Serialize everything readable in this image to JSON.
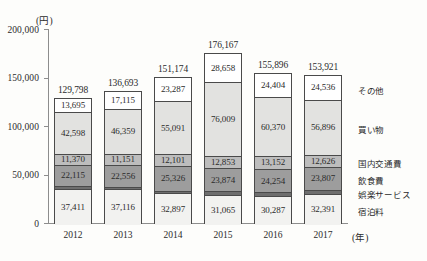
{
  "chart_data": {
    "type": "bar",
    "stacked": true,
    "title": "",
    "xlabel": "(年)",
    "ylabel": "(円)",
    "ylim": [
      0,
      200000
    ],
    "grid": false,
    "legend_position": "right",
    "y_ticks": [
      "0",
      "50,000",
      "100,000",
      "150,000",
      "200,000"
    ],
    "y_tick_values": [
      0,
      50000,
      100000,
      150000,
      200000
    ],
    "categories": [
      "2012",
      "2013",
      "2014",
      "2015",
      "2016",
      "2017"
    ],
    "totals": [
      129798,
      136693,
      151174,
      176167,
      155896,
      153921
    ],
    "total_labels": [
      "129,798",
      "136,693",
      "151,174",
      "176,167",
      "155,896",
      "153,921"
    ],
    "series": [
      {
        "name": "宿泊料",
        "color": "#f2f2f0",
        "values": [
          37411,
          37116,
          32897,
          31065,
          30287,
          32391
        ],
        "labels": [
          "37,411",
          "37,116",
          "32,897",
          "31,065",
          "30,287",
          "32,391"
        ]
      },
      {
        "name": "飲食費",
        "color": "#9d9d9d",
        "values": [
          22115,
          22556,
          25326,
          23874,
          24254,
          23807
        ],
        "labels": [
          "22,115",
          "22,556",
          "25,326",
          "23,874",
          "24,254",
          "23,807"
        ]
      },
      {
        "name": "国内交通費",
        "color": "#bdbdbd",
        "values": [
          11370,
          11151,
          12101,
          12853,
          13152,
          12626
        ],
        "labels": [
          "11,370",
          "11,151",
          "12,101",
          "12,853",
          "13,152",
          "12,626"
        ]
      },
      {
        "name": "買い物",
        "color": "#e2e2e0",
        "values": [
          42598,
          46359,
          55091,
          76009,
          60370,
          56896
        ],
        "labels": [
          "42,598",
          "46,359",
          "55,091",
          "76,009",
          "60,370",
          "56,896"
        ]
      },
      {
        "name": "その他",
        "color": "#ffffff",
        "values": [
          13695,
          17115,
          23287,
          28658,
          24404,
          24536
        ],
        "labels": [
          "13,695",
          "17,115",
          "23,287",
          "28,658",
          "24,404",
          "24,536"
        ]
      }
    ],
    "unlabeled_segments": [
      {
        "name": "娯楽サービス",
        "color": "#6e6e6e",
        "values": [
          2609,
          2396,
          2472,
          3708,
          3429,
          3665
        ],
        "note": "thin dark band between 宿泊料 and 飲食費 (unlabeled in figure)"
      }
    ],
    "legend_entries": [
      {
        "label": "その他",
        "color": "#ffffff"
      },
      {
        "label": "買い物",
        "color": "#e2e2e0"
      },
      {
        "label": "娯楽サービス",
        "color": "#6e6e6e"
      },
      {
        "label": "国内交通費",
        "color": "#bdbdbd"
      },
      {
        "label": "飲食費",
        "color": "#9d9d9d"
      },
      {
        "label": "宿泊料",
        "color": "#f2f2f0"
      }
    ]
  }
}
